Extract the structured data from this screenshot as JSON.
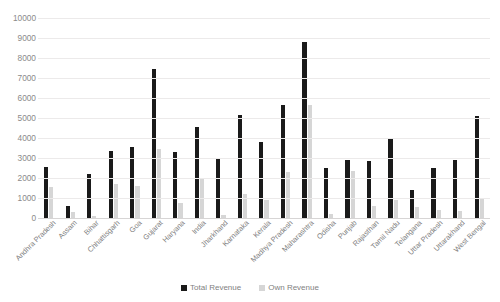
{
  "chart_data": {
    "type": "bar",
    "title": "",
    "xlabel": "",
    "ylabel": "",
    "ylim": [
      0,
      10000
    ],
    "ytick_step": 1000,
    "yticks": [
      "10000",
      "9000",
      "8000",
      "7000",
      "6000",
      "5000",
      "4000",
      "3000",
      "2000",
      "1000",
      "0"
    ],
    "grid": true,
    "legend_position": "bottom",
    "categories": [
      "Andhra Pradesh",
      "Assam",
      "Bihar",
      "Chhattisgarh",
      "Goa",
      "Gujarat",
      "Haryana",
      "India",
      "Jharkhand",
      "Karnataka",
      "Kerala",
      "Madhya Pradesh",
      "Maharashtra",
      "Odisha",
      "Punjab",
      "Rajasthan",
      "Tamil Nadu",
      "Telangana",
      "Uttar Pradesh",
      "Uttarakhand",
      "West Bengal"
    ],
    "series": [
      {
        "name": "Total Revenue",
        "color": "#1a1a1a",
        "values": [
          2530,
          620,
          2200,
          3330,
          3560,
          7450,
          3280,
          4560,
          2980,
          5150,
          3780,
          5650,
          8800,
          2480,
          2900,
          2870,
          3940,
          1420,
          2500,
          2880,
          5120
        ]
      },
      {
        "name": "Own Revenue",
        "color": "#d6d6d6",
        "values": [
          1530,
          320,
          120,
          1700,
          1620,
          3450,
          760,
          1950,
          170,
          1210,
          880,
          2310,
          5650,
          220,
          2330,
          600,
          900,
          530,
          420,
          360,
          1020
        ]
      }
    ]
  },
  "legend": {
    "items": [
      {
        "label": "Total Revenue",
        "swatch": "total"
      },
      {
        "label": "Own Revenue",
        "swatch": "own"
      }
    ]
  }
}
